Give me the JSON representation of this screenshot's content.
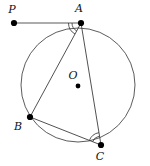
{
  "figure": {
    "background_color": "#ffffff",
    "stroke_color": "#4a4a4a",
    "label_color": "#111111",
    "width": 150,
    "height": 166
  },
  "circle": {
    "name": "circumscribed-circle",
    "center_x": 78,
    "center_y": 85,
    "radius": 57
  },
  "points": [
    {
      "id": "P",
      "label": "P",
      "x": 14,
      "y": 23,
      "label_x": 12,
      "label_y": 13,
      "on_circle": false,
      "role": "external-tangent-point"
    },
    {
      "id": "A",
      "label": "A",
      "x": 81,
      "y": 23,
      "label_x": 79,
      "label_y": 12,
      "on_circle": true,
      "role": "tangency-point"
    },
    {
      "id": "B",
      "label": "B",
      "x": 30,
      "y": 117,
      "label_x": 18,
      "label_y": 130,
      "on_circle": true,
      "role": "triangle-vertex"
    },
    {
      "id": "C",
      "label": "C",
      "x": 101,
      "y": 145,
      "label_x": 100,
      "label_y": 160,
      "on_circle": true,
      "role": "triangle-vertex"
    },
    {
      "id": "O",
      "label": "O",
      "x": 78,
      "y": 86,
      "label_x": 73,
      "label_y": 79,
      "on_circle": false,
      "role": "circle-center"
    }
  ],
  "segments": [
    {
      "id": "PA",
      "from": "P",
      "to": "A",
      "kind": "tangent"
    },
    {
      "id": "AB",
      "from": "A",
      "to": "B",
      "kind": "chord"
    },
    {
      "id": "AC",
      "from": "A",
      "to": "C",
      "kind": "chord"
    },
    {
      "id": "BC",
      "from": "B",
      "to": "C",
      "kind": "chord"
    }
  ],
  "angle_marks": [
    {
      "id": "angle-PAB",
      "vertex": "A",
      "between": "PA and AB",
      "arc_count": 2,
      "label": ""
    },
    {
      "id": "angle-BCA",
      "vertex": "C",
      "between": "CB and CA",
      "arc_count": 2,
      "label": ""
    }
  ]
}
